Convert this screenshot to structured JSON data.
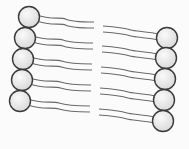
{
  "diagram": {
    "colors": {
      "background": "#fbfbfb",
      "head_fill": "#e6e6e6",
      "head_highlight": "#f8f8f8",
      "head_stroke": "#3a3a3a",
      "tail_stroke": "#6a6a6a"
    },
    "left_leaflet": {
      "heads": [
        {
          "cx": 29,
          "cy": 17,
          "r": 10.5
        },
        {
          "cx": 25,
          "cy": 38,
          "r": 10.5
        },
        {
          "cx": 23,
          "cy": 59,
          "r": 10.5
        },
        {
          "cx": 22,
          "cy": 80,
          "r": 10.5
        },
        {
          "cx": 20,
          "cy": 101,
          "r": 10.5
        }
      ],
      "tail_end_x": 94
    },
    "right_leaflet": {
      "heads": [
        {
          "cx": 167,
          "cy": 38,
          "r": 10.5
        },
        {
          "cx": 166,
          "cy": 58,
          "r": 10.5
        },
        {
          "cx": 165,
          "cy": 79,
          "r": 10.5
        },
        {
          "cx": 164,
          "cy": 100,
          "r": 10.5
        },
        {
          "cx": 163,
          "cy": 121,
          "r": 10.5
        }
      ],
      "tail_start_x": 103
    }
  }
}
